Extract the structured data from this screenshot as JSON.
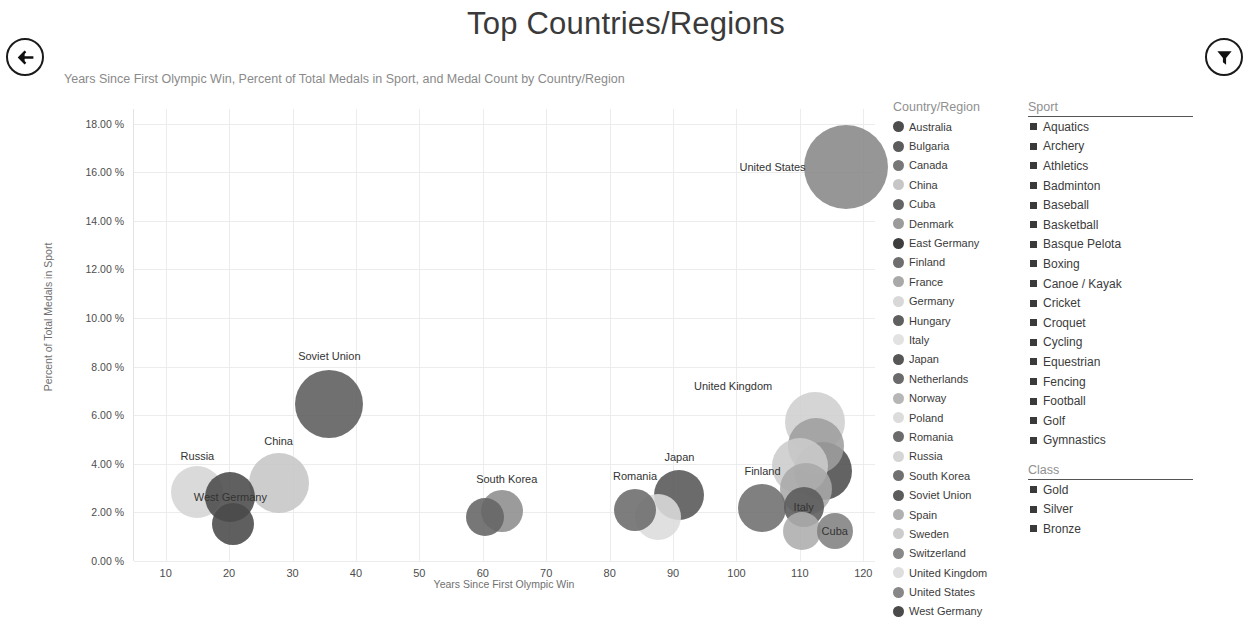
{
  "header": {
    "title": "Top Countries/Regions",
    "subtitle": "Years Since First Olympic Win, Percent of Total Medals in Sport, and Medal Count by Country/Region",
    "back_icon": "back-arrow-icon",
    "filter_icon": "filter-funnel-icon"
  },
  "chart_data": {
    "type": "scatter",
    "title": "Top Countries/Regions",
    "subtitle": "Years Since First Olympic Win, Percent of Total Medals in Sport, and Medal Count by Country/Region",
    "xlabel": "Years Since First Olympic Win",
    "ylabel": "Percent of Total Medals in Sport",
    "xlim": [
      5,
      122
    ],
    "ylim": [
      0,
      18.6
    ],
    "xticks": [
      "10",
      "20",
      "30",
      "40",
      "50",
      "60",
      "70",
      "80",
      "90",
      "100",
      "110",
      "120"
    ],
    "xtick_values": [
      10,
      20,
      30,
      40,
      50,
      60,
      70,
      80,
      90,
      100,
      110,
      120
    ],
    "yticks": [
      "0.00 %",
      "2.00 %",
      "4.00 %",
      "6.00 %",
      "8.00 %",
      "10.00 %",
      "12.00 %",
      "14.00 %",
      "16.00 %",
      "18.00 %"
    ],
    "ytick_values": [
      0,
      2,
      4,
      6,
      8,
      10,
      12,
      14,
      16,
      18
    ],
    "grid": true,
    "legend_position": "right",
    "size_encoding": "Medal Count",
    "points": [
      {
        "label": "Russia",
        "x": 15.0,
        "y": 2.85,
        "r": 26,
        "color": "#d5d5d5",
        "label_dx": 0,
        "label_dy": -36,
        "show_label": true
      },
      {
        "label": "West Germany",
        "x": 20.2,
        "y": 2.62,
        "r": 25,
        "color": "#4a4a4a",
        "label_dx": 0,
        "label_dy": 0,
        "show_label": true
      },
      {
        "label": "East Germany",
        "x": 20.6,
        "y": 1.52,
        "r": 21,
        "color": "#494949",
        "label_dx": 0,
        "label_dy": 0,
        "show_label": false
      },
      {
        "label": "China",
        "x": 27.8,
        "y": 3.22,
        "r": 30,
        "color": "#c6c6c6",
        "label_dx": 0,
        "label_dy": -42,
        "show_label": true
      },
      {
        "label": "Soviet Union",
        "x": 35.8,
        "y": 6.48,
        "r": 34,
        "color": "#5c5c5c",
        "label_dx": 0,
        "label_dy": -48,
        "show_label": true
      },
      {
        "label": "South Korea",
        "x": 60.3,
        "y": 1.82,
        "r": 19,
        "color": "#646464",
        "label_dx": 22,
        "label_dy": -38,
        "show_label": true
      },
      {
        "label": "Spain",
        "x": 63.0,
        "y": 2.06,
        "r": 21,
        "color": "#8d8d8d",
        "label_dx": 0,
        "label_dy": 0,
        "show_label": false
      },
      {
        "label": "Romania",
        "x": 84.0,
        "y": 2.1,
        "r": 21,
        "color": "#6b6b6b",
        "label_dx": 0,
        "label_dy": -34,
        "show_label": true
      },
      {
        "label": "Poland",
        "x": 87.6,
        "y": 1.82,
        "r": 23,
        "color": "#dcdcdc",
        "label_dx": 0,
        "label_dy": 0,
        "show_label": false
      },
      {
        "label": "Japan",
        "x": 91.0,
        "y": 2.72,
        "r": 25,
        "color": "#565656",
        "label_dx": 0,
        "label_dy": -38,
        "show_label": true
      },
      {
        "label": "Finland",
        "x": 104.1,
        "y": 2.18,
        "r": 24,
        "color": "#6e6e6e",
        "label_dx": 0,
        "label_dy": -37,
        "show_label": true
      },
      {
        "label": "United Kingdom",
        "x": 112.4,
        "y": 5.72,
        "r": 30,
        "color": "#cfcfcf",
        "label_dx": -82,
        "label_dy": -36,
        "show_label": true
      },
      {
        "label": "Germany",
        "x": 112.5,
        "y": 4.72,
        "r": 28,
        "color": "#9e9e9e",
        "label_dx": 0,
        "label_dy": 0,
        "show_label": false
      },
      {
        "label": "Sweden",
        "x": 110.0,
        "y": 3.9,
        "r": 28,
        "color": "#cccccc",
        "label_dx": 0,
        "label_dy": 0,
        "show_label": false
      },
      {
        "label": "Australia",
        "x": 113.6,
        "y": 3.72,
        "r": 29,
        "color": "#4d4d4d",
        "label_dx": 0,
        "label_dy": 0,
        "show_label": false
      },
      {
        "label": "France",
        "x": 111.0,
        "y": 2.95,
        "r": 26,
        "color": "#a9a9a9",
        "label_dx": 0,
        "label_dy": 0,
        "show_label": false
      },
      {
        "label": "Italy",
        "x": 110.6,
        "y": 2.22,
        "r": 20,
        "color": "#5a5a5a",
        "label_dx": 0,
        "label_dy": 0,
        "show_label": true
      },
      {
        "label": "Hungary",
        "x": 110.3,
        "y": 1.25,
        "r": 19,
        "color": "#adadad",
        "label_dx": 0,
        "label_dy": 0,
        "show_label": false
      },
      {
        "label": "Cuba",
        "x": 115.5,
        "y": 1.22,
        "r": 18,
        "color": "#818181",
        "label_dx": 0,
        "label_dy": 0,
        "show_label": true
      },
      {
        "label": "United States",
        "x": 117.2,
        "y": 16.2,
        "r": 42,
        "color": "#878787",
        "label_dx": -73,
        "label_dy": 0,
        "show_label": true
      }
    ]
  },
  "legends": {
    "country": {
      "title": "Country/Region",
      "items": [
        {
          "label": "Australia",
          "color": "#4d4d4d"
        },
        {
          "label": "Bulgaria",
          "color": "#5c5c5c"
        },
        {
          "label": "Canada",
          "color": "#777777"
        },
        {
          "label": "China",
          "color": "#c6c6c6"
        },
        {
          "label": "Cuba",
          "color": "#646464"
        },
        {
          "label": "Denmark",
          "color": "#9b9b9b"
        },
        {
          "label": "East Germany",
          "color": "#3d3d3d"
        },
        {
          "label": "Finland",
          "color": "#6e6e6e"
        },
        {
          "label": "France",
          "color": "#a9a9a9"
        },
        {
          "label": "Germany",
          "color": "#d8d8d8"
        },
        {
          "label": "Hungary",
          "color": "#5f5f5f"
        },
        {
          "label": "Italy",
          "color": "#e2e2e2"
        },
        {
          "label": "Japan",
          "color": "#565656"
        },
        {
          "label": "Netherlands",
          "color": "#6a6a6a"
        },
        {
          "label": "Norway",
          "color": "#b6b6b6"
        },
        {
          "label": "Poland",
          "color": "#dcdcdc"
        },
        {
          "label": "Romania",
          "color": "#6b6b6b"
        },
        {
          "label": "Russia",
          "color": "#d5d5d5"
        },
        {
          "label": "South Korea",
          "color": "#707070"
        },
        {
          "label": "Soviet Union",
          "color": "#5c5c5c"
        },
        {
          "label": "Spain",
          "color": "#b0b0b0"
        },
        {
          "label": "Sweden",
          "color": "#cccccc"
        },
        {
          "label": "Switzerland",
          "color": "#888888"
        },
        {
          "label": "United Kingdom",
          "color": "#dedede"
        },
        {
          "label": "United States",
          "color": "#878787"
        },
        {
          "label": "West Germany",
          "color": "#4a4a4a"
        }
      ]
    },
    "sport": {
      "title": "Sport",
      "items": [
        "Aquatics",
        "Archery",
        "Athletics",
        "Badminton",
        "Baseball",
        "Basketball",
        "Basque Pelota",
        "Boxing",
        "Canoe / Kayak",
        "Cricket",
        "Croquet",
        "Cycling",
        "Equestrian",
        "Fencing",
        "Football",
        "Golf",
        "Gymnastics"
      ]
    },
    "class": {
      "title": "Class",
      "items": [
        "Gold",
        "Silver",
        "Bronze"
      ]
    }
  }
}
